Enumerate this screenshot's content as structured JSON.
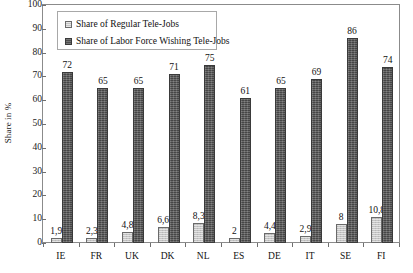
{
  "chart_data": {
    "type": "bar",
    "title": "",
    "subtitle": "",
    "xlabel": "",
    "ylabel": "Share in %",
    "ylim": [
      0,
      100
    ],
    "ytick_step": 10,
    "yticks": [
      "100",
      "90",
      "80",
      "70",
      "60",
      "50",
      "40",
      "30",
      "20",
      "10",
      "0"
    ],
    "grid": false,
    "legend_position": "top-left-inside",
    "decimal_separator": ",",
    "categories": [
      "IE",
      "FR",
      "UK",
      "DK",
      "NL",
      "ES",
      "DE",
      "IT",
      "SE",
      "FI"
    ],
    "series": [
      {
        "name": "Share of Regular Tele-Jobs",
        "color": "#c4c4c4",
        "values": [
          1.9,
          2.3,
          4.8,
          6.6,
          8.3,
          2,
          4.4,
          2.9,
          8,
          10.8
        ],
        "labels": [
          "1,9",
          "2,3",
          "4,8",
          "6,6",
          "8,3",
          "2",
          "4,4",
          "2,9",
          "8",
          "10,8"
        ]
      },
      {
        "name": "Share of Labor Force Wishing Tele-Jobs",
        "color": "#585858",
        "values": [
          72,
          65,
          65,
          71,
          75,
          61,
          65,
          69,
          86,
          74
        ],
        "labels": [
          "72",
          "65",
          "65",
          "71",
          "75",
          "61",
          "65",
          "69",
          "86",
          "74"
        ]
      }
    ]
  },
  "legend": {
    "items": [
      {
        "label": "Share of Regular Tele-Jobs",
        "swatch": "light"
      },
      {
        "label": "Share of Labor Force Wishing Tele-Jobs",
        "swatch": "dark"
      }
    ]
  },
  "axis": {
    "y_title": "Share in %"
  }
}
